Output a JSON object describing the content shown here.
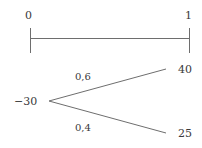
{
  "timeline": {
    "start_label": "0",
    "end_label": "1"
  },
  "tree": {
    "root_value": "−30",
    "branches": [
      {
        "probability": "0,6",
        "outcome": "40"
      },
      {
        "probability": "0,4",
        "outcome": "25"
      }
    ]
  },
  "colors": {
    "line": "#6e6e6e",
    "text": "#3a3a3a"
  }
}
